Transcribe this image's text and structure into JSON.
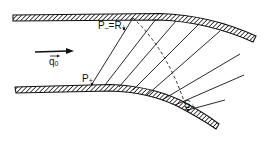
{
  "diagram": {
    "type": "supersonic channel flow with expansion fan (characteristics)",
    "labels": {
      "flow_velocity": "q",
      "flow_velocity_subscript": "0",
      "point_p_plus": "P",
      "point_p_plus_sub": "+",
      "point_p_minus_r_plus": "P",
      "point_p_minus_sub": "–",
      "equals": "=R",
      "point_r_plus_sub": "+",
      "point_s_plus": "S",
      "point_s_plus_sub": "+"
    },
    "elements": [
      "upper wall (hatched), straight then curving downward",
      "lower wall (hatched), straight then curving downward",
      "flow arrow pointing right labelled q0 vector",
      "fan of straight characteristic lines between walls",
      "dashed curved characteristic from upper wall to S+"
    ],
    "colors": {
      "ink": "#111111",
      "background": "#ffffff"
    }
  }
}
